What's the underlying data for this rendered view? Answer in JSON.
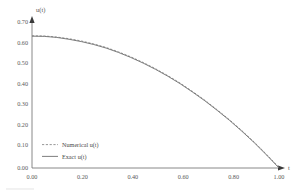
{
  "chart_data": {
    "type": "line",
    "title": "",
    "xlabel": "t",
    "ylabel": "u(t)",
    "xlim": [
      0.0,
      1.0
    ],
    "ylim": [
      0.0,
      0.7
    ],
    "grid": false,
    "legend_position": "lower-left",
    "x_ticks": [
      "0.00",
      "0.20",
      "0.40",
      "0.60",
      "0.80",
      "1.00"
    ],
    "x_tick_values": [
      0.0,
      0.2,
      0.4,
      0.6,
      0.8,
      1.0
    ],
    "y_ticks": [
      "0.70",
      "0.60",
      "0.50",
      "0.40",
      "0.30",
      "0.20",
      "0.10",
      "0.00"
    ],
    "y_tick_values": [
      0.7,
      0.6,
      0.5,
      0.4,
      0.3,
      0.2,
      0.1,
      0.0
    ],
    "x": [
      0.0,
      0.05,
      0.1,
      0.15,
      0.2,
      0.25,
      0.3,
      0.35,
      0.4,
      0.45,
      0.5,
      0.55,
      0.6,
      0.65,
      0.7,
      0.75,
      0.8,
      0.85,
      0.9,
      0.95,
      1.0
    ],
    "series": [
      {
        "name": "Numerical u(t)",
        "style": "dashed",
        "color": "#8a8a8a",
        "values": [
          0.634,
          0.633,
          0.628,
          0.62,
          0.609,
          0.595,
          0.578,
          0.557,
          0.533,
          0.506,
          0.476,
          0.443,
          0.407,
          0.367,
          0.325,
          0.279,
          0.231,
          0.179,
          0.124,
          0.065,
          0.003
        ]
      },
      {
        "name": "Exact u(t)",
        "style": "solid",
        "color": "#6f6f6f",
        "values": [
          0.632,
          0.631,
          0.626,
          0.617,
          0.606,
          0.592,
          0.575,
          0.554,
          0.53,
          0.503,
          0.473,
          0.44,
          0.404,
          0.364,
          0.322,
          0.276,
          0.228,
          0.176,
          0.121,
          0.062,
          0.0
        ]
      }
    ]
  },
  "legend": {
    "items": [
      {
        "label": "Numerical u(t)",
        "style": "dashed"
      },
      {
        "label": "Exact u(t)",
        "style": "solid"
      }
    ]
  },
  "axes": {
    "y_axis_title": "u(t)",
    "x_axis_title": "t"
  }
}
